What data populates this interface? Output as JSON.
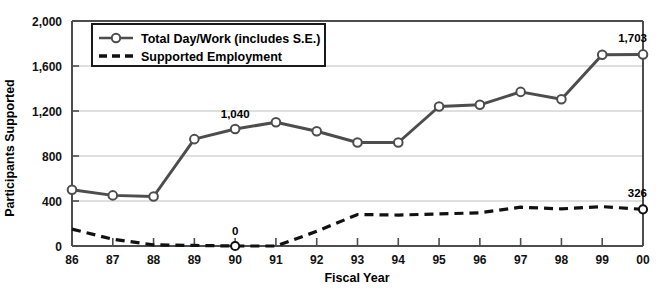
{
  "chart_data": {
    "type": "line",
    "title": "",
    "xlabel": "Fiscal Year",
    "ylabel": "Participants Supported",
    "categories": [
      "86",
      "87",
      "88",
      "89",
      "90",
      "91",
      "92",
      "93",
      "94",
      "95",
      "96",
      "97",
      "98",
      "99",
      "00"
    ],
    "x": [
      86,
      87,
      88,
      89,
      90,
      91,
      92,
      93,
      94,
      95,
      96,
      97,
      98,
      99,
      100
    ],
    "ylim": [
      0,
      2000
    ],
    "yticks": [
      0,
      400,
      800,
      1200,
      1600,
      2000
    ],
    "ytick_labels": [
      "0",
      "400",
      "800",
      "1,200",
      "1,600",
      "2,000"
    ],
    "grid": "horizontal",
    "legend_position": "top-left-inside",
    "series": [
      {
        "name": "Total Day/Work (includes S.E.)",
        "style": "solid-with-open-circle-markers",
        "color": "#4d4d4d",
        "values": [
          500,
          450,
          440,
          950,
          1040,
          1100,
          1020,
          920,
          920,
          1240,
          1255,
          1370,
          1305,
          1700,
          1703
        ]
      },
      {
        "name": "Supported Employment",
        "style": "dashed",
        "color": "#111111",
        "values": [
          150,
          60,
          10,
          5,
          0,
          0,
          130,
          280,
          275,
          285,
          295,
          345,
          330,
          350,
          326
        ]
      }
    ],
    "annotations": [
      {
        "label": "1,040",
        "series": "Total Day/Work (includes S.E.)",
        "category": "90",
        "value": 1040
      },
      {
        "label": "1,703",
        "series": "Total Day/Work (includes S.E.)",
        "category": "00",
        "value": 1703
      },
      {
        "label": "0",
        "series": "Supported Employment",
        "category": "90",
        "value": 0
      },
      {
        "label": "326",
        "series": "Supported Employment",
        "category": "00",
        "value": 326
      }
    ]
  },
  "axes": {
    "y_title": "Participants Supported",
    "x_title": "Fiscal Year",
    "y_ticks": [
      "2,000",
      "1,600",
      "1,200",
      "800",
      "400",
      "0"
    ],
    "x_ticks": [
      "86",
      "87",
      "88",
      "89",
      "90",
      "91",
      "92",
      "93",
      "94",
      "95",
      "96",
      "97",
      "98",
      "99",
      "00"
    ]
  },
  "legend": {
    "items": [
      {
        "label": "Total Day/Work (includes S.E.)",
        "marker": "line-circle-marker"
      },
      {
        "label": "Supported Employment",
        "marker": "dashed-line-marker"
      }
    ]
  },
  "annotations": {
    "peak_1040": "1,040",
    "end_total": "1,703",
    "zero_se": "0",
    "end_se": "326"
  },
  "colors": {
    "total_line": "#4d4d4d",
    "se_line": "#111111",
    "gridline": "#bfbfbf",
    "axis": "#4d4d4d",
    "background": "#ffffff"
  }
}
